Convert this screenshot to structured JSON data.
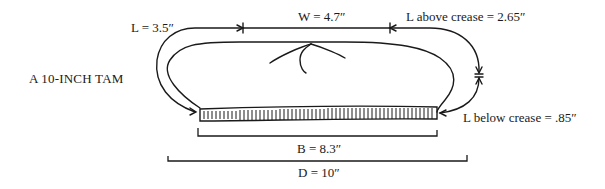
{
  "title": "A 10-INCH TAM",
  "labels": {
    "L": "L = 3.5″",
    "W": "W = 4.7″",
    "L_above": "L above crease = 2.65″",
    "L_below": "L below crease = .85″",
    "B": "B = 8.3″",
    "D": "D = 10″"
  },
  "measurements": {
    "L": 3.5,
    "W": 4.7,
    "L_above_crease": 2.65,
    "L_below_crease": 0.85,
    "B": 8.3,
    "D": 10,
    "unit": "inch"
  },
  "colors": {
    "ink": "#1a1a1a",
    "background": "#ffffff"
  }
}
